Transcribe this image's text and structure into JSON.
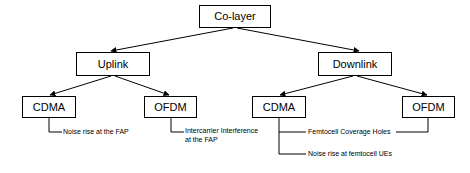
{
  "diagram": {
    "stroke_color": "#000000",
    "background_color": "#ffffff",
    "text_color": "#000000",
    "nodes": {
      "root": {
        "label": "Co-layer",
        "x": 199,
        "y": 5,
        "w": 72,
        "h": 23,
        "font_size": 11
      },
      "uplink": {
        "label": "Uplink",
        "x": 76,
        "y": 52,
        "w": 74,
        "h": 24,
        "font_size": 11
      },
      "downlink": {
        "label": "Downlink",
        "x": 318,
        "y": 52,
        "w": 74,
        "h": 24,
        "font_size": 11
      },
      "ul_cdma": {
        "label": "CDMA",
        "x": 22,
        "y": 96,
        "w": 54,
        "h": 22,
        "font_size": 11
      },
      "ul_ofdm": {
        "label": "OFDM",
        "x": 144,
        "y": 96,
        "w": 53,
        "h": 22,
        "font_size": 11
      },
      "dl_cdma": {
        "label": "CDMA",
        "x": 252,
        "y": 96,
        "w": 54,
        "h": 22,
        "font_size": 11
      },
      "dl_ofdm": {
        "label": "OFDM",
        "x": 402,
        "y": 96,
        "w": 53,
        "h": 22,
        "font_size": 11
      }
    },
    "leaves": {
      "ul_cdma_leaf": {
        "label": "Noise rise at the FAP",
        "x": 63,
        "y": 129,
        "font_size": 7
      },
      "ul_ofdm_leaf": {
        "label": "Intercarrier Interference\nat the FAP",
        "x": 185,
        "y": 127,
        "font_size": 7
      },
      "dl_shared_leaf": {
        "label": "Femtocell Coverage Holes",
        "x": 307,
        "y": 129,
        "font_size": 7
      },
      "dl_cdma_leaf": {
        "label": "Noise rise at femtocell UEs",
        "x": 307,
        "y": 151,
        "font_size": 7
      }
    },
    "edges": [
      {
        "name": "root-to-uplink",
        "type": "arrow",
        "from": "Co-layer",
        "to": "Uplink"
      },
      {
        "name": "root-to-downlink",
        "type": "arrow",
        "from": "Co-layer",
        "to": "Downlink"
      },
      {
        "name": "uplink-to-cdma",
        "type": "arrow",
        "from": "Uplink",
        "to": "CDMA"
      },
      {
        "name": "uplink-to-ofdm",
        "type": "arrow",
        "from": "Uplink",
        "to": "OFDM"
      },
      {
        "name": "downlink-to-cdma",
        "type": "arrow",
        "from": "Downlink",
        "to": "CDMA"
      },
      {
        "name": "downlink-to-ofdm",
        "type": "arrow",
        "from": "Downlink",
        "to": "OFDM"
      },
      {
        "name": "ul-cdma-to-leaf",
        "type": "elbow",
        "from": "CDMA",
        "to": "Noise rise at the FAP"
      },
      {
        "name": "ul-ofdm-to-leaf",
        "type": "elbow",
        "from": "OFDM",
        "to": "Intercarrier Interference at the FAP"
      },
      {
        "name": "dl-cdma-to-coverage-holes",
        "type": "elbow",
        "from": "CDMA",
        "to": "Femtocell Coverage Holes"
      },
      {
        "name": "dl-cdma-to-noise-rise",
        "type": "elbow",
        "from": "CDMA",
        "to": "Noise rise at femtocell UEs"
      },
      {
        "name": "dl-ofdm-to-coverage-holes",
        "type": "elbow",
        "from": "OFDM",
        "to": "Femtocell Coverage Holes"
      }
    ]
  }
}
